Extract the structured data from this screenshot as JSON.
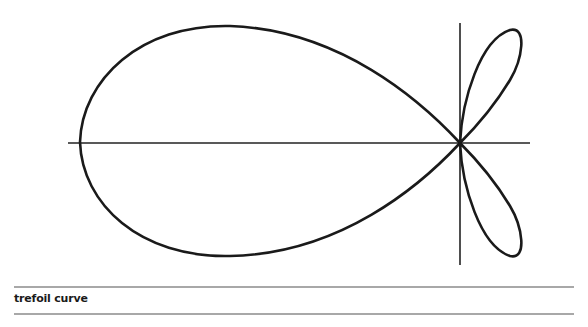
{
  "figure": {
    "title": "trefoil curve",
    "curve_color": "#1a1a1a",
    "axis_color": "#222222",
    "origin": [
      460,
      143
    ],
    "axes": {
      "horizontal": {
        "x1": 68,
        "x2": 530
      },
      "vertical": {
        "y1": 23,
        "y2": 265
      }
    },
    "paths": {
      "main_loop": "M460,143 C420,100 340,30 230,26 C140,24 82,80 80,142 C82,204 140,258 230,256 C340,254 420,186 460,143 Z",
      "upper_lobe": "M460,143 C462,100 480,40 510,30 C528,26 522,60 510,80 C495,105 475,128 460,143 Z",
      "lower_lobe": "M460,143 C462,186 480,246 510,256 C528,260 522,226 510,206 C495,181 475,158 460,143 Z"
    }
  },
  "caption": {
    "label": "trefoil curve"
  }
}
